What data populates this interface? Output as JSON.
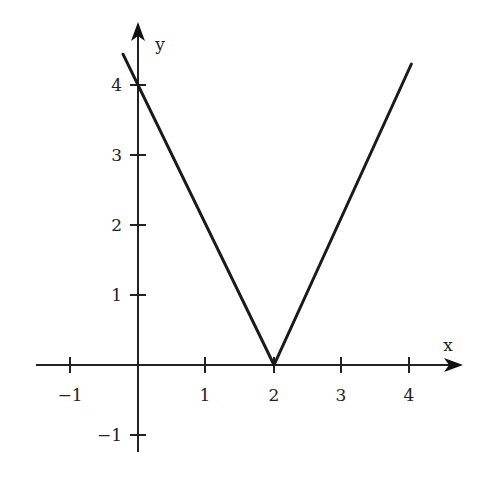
{
  "chart_data": {
    "type": "line",
    "title": "",
    "xlabel": "x",
    "ylabel": "y",
    "function": "y = 2|x - 2|",
    "x": [
      -0.22,
      2,
      4.02
    ],
    "series": [
      {
        "name": "y = 2|x - 2|",
        "x": [
          -0.22,
          2,
          4.02
        ],
        "values": [
          4.44,
          0,
          4.3
        ]
      }
    ],
    "x_ticks": [
      -1,
      1,
      2,
      3,
      4
    ],
    "x_tick_labels": [
      "−1",
      "1",
      "2",
      "3",
      "4"
    ],
    "y_ticks": [
      4,
      3,
      2,
      1,
      -1
    ],
    "y_tick_labels": [
      "4",
      "3",
      "2",
      "1",
      "−1"
    ],
    "xlim": [
      -1.5,
      4.8
    ],
    "ylim": [
      -1.3,
      4.7
    ],
    "grid": false,
    "legend": null,
    "colors": {
      "line": "#1a1a1a",
      "axes": "#222222",
      "background": "#ffffff"
    }
  }
}
